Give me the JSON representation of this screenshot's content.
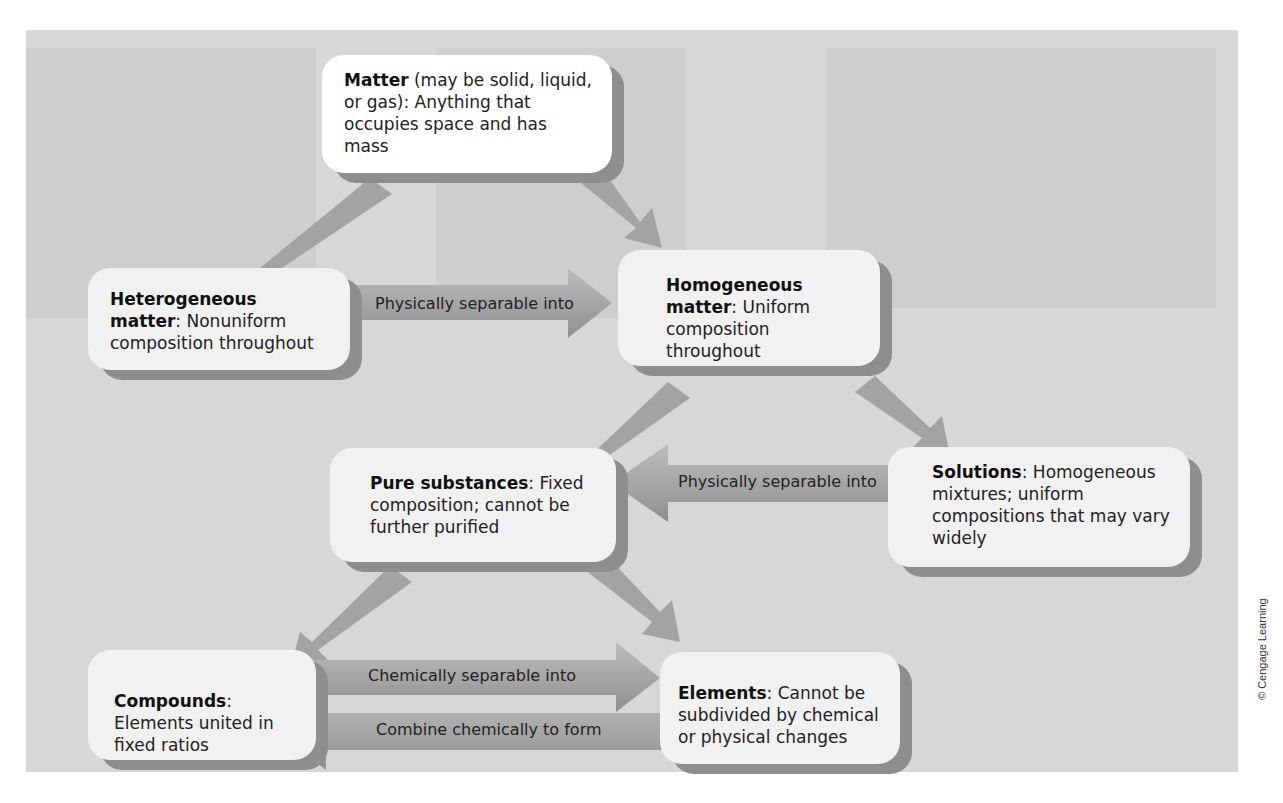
{
  "figure": {
    "credit": "© Cengage Learning",
    "colors": {
      "panel": "#d7d7d7",
      "box": "#f1f1f1",
      "box_shadow": "#8e8e8e",
      "arrow": "#9a9a9a"
    }
  },
  "nodes": {
    "matter": {
      "title": "Matter",
      "text": " (may be solid, liquid, or gas): Anything that occupies space and has mass"
    },
    "heterogeneous": {
      "title": "Heterogeneous matter",
      "text": ": Nonuniform composition throughout"
    },
    "homogeneous": {
      "title": "Homogeneous matter",
      "text": ": Uniform composition throughout"
    },
    "pure_substances": {
      "title": "Pure substances",
      "text": ": Fixed composition; cannot be further purified"
    },
    "solutions": {
      "title": "Solutions",
      "text": ": Homogeneous mixtures; uniform compositions that may vary widely"
    },
    "compounds": {
      "title": "Compounds",
      "text": ": Elements united in fixed ratios"
    },
    "elements": {
      "title": "Elements",
      "text": ": Cannot be subdivided by chemical or physical changes"
    }
  },
  "edges": [
    {
      "from": "matter",
      "to": "heterogeneous",
      "label": ""
    },
    {
      "from": "matter",
      "to": "homogeneous",
      "label": ""
    },
    {
      "from": "heterogeneous",
      "to": "homogeneous",
      "label": "Physically separable into"
    },
    {
      "from": "homogeneous",
      "to": "pure_substances",
      "label": ""
    },
    {
      "from": "homogeneous",
      "to": "solutions",
      "label": ""
    },
    {
      "from": "solutions",
      "to": "pure_substances",
      "label": "Physically separable into"
    },
    {
      "from": "pure_substances",
      "to": "compounds",
      "label": ""
    },
    {
      "from": "pure_substances",
      "to": "elements",
      "label": ""
    },
    {
      "from": "compounds",
      "to": "elements",
      "label": "Chemically separable into"
    },
    {
      "from": "elements",
      "to": "compounds",
      "label": "Combine chemically to form"
    }
  ]
}
